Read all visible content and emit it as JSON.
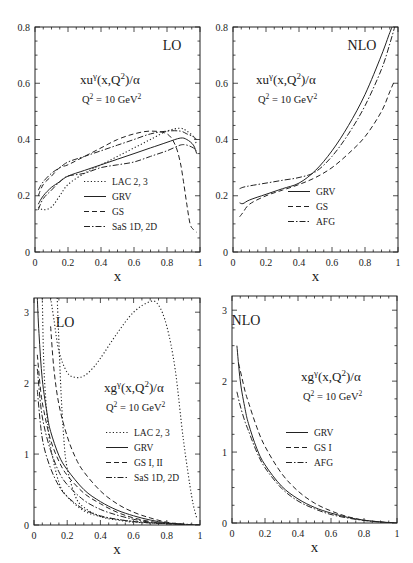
{
  "chart_data": [
    {
      "id": "top-left",
      "type": "line",
      "tag": "LO",
      "title": "xuγ(x,Q²)/α",
      "subtitle": "Q² = 10 GeV²",
      "xlabel": "x",
      "ylabel": "",
      "xlim": [
        0,
        1
      ],
      "ylim": [
        0,
        0.8
      ],
      "xticks": [
        "0",
        "0.2",
        "0.4",
        "0.6",
        "0.8",
        "1"
      ],
      "yticks": [
        "0",
        "0.2",
        "0.4",
        "0.6",
        "0.8"
      ],
      "frame": {
        "x0": 35,
        "x1": 200,
        "y0": 27,
        "y1": 252
      },
      "legend": [
        "LAC 2, 3",
        "GRV",
        "GS",
        "SaS 1D, 2D"
      ],
      "legend_pos": {
        "x": 112,
        "y": 185,
        "dy": 15
      },
      "tag_pos": {
        "x": 172,
        "y": 50
      },
      "title_pos": {
        "x": 80,
        "y": 84
      },
      "series": [
        {
          "name": "LAC 2, 3",
          "style": "dotted",
          "x": [
            0.02,
            0.05,
            0.1,
            0.15,
            0.2,
            0.3,
            0.4,
            0.5,
            0.6,
            0.7,
            0.8,
            0.88,
            0.92,
            0.96,
            0.98
          ],
          "y": [
            0.16,
            0.15,
            0.16,
            0.2,
            0.24,
            0.28,
            0.31,
            0.34,
            0.37,
            0.4,
            0.43,
            0.44,
            0.43,
            0.41,
            0.38
          ]
        },
        {
          "name": "GRV",
          "style": "solid",
          "x": [
            0.02,
            0.05,
            0.1,
            0.15,
            0.2,
            0.3,
            0.4,
            0.5,
            0.6,
            0.7,
            0.8,
            0.88,
            0.92,
            0.96,
            0.98
          ],
          "y": [
            0.17,
            0.2,
            0.23,
            0.25,
            0.27,
            0.29,
            0.31,
            0.33,
            0.35,
            0.37,
            0.39,
            0.405,
            0.4,
            0.38,
            0.35
          ]
        },
        {
          "name": "GS",
          "style": "dashed",
          "x": [
            0.02,
            0.05,
            0.1,
            0.15,
            0.2,
            0.3,
            0.4,
            0.5,
            0.6,
            0.7,
            0.8,
            0.85,
            0.88,
            0.9,
            0.92,
            0.94,
            0.96,
            0.98
          ],
          "y": [
            0.2,
            0.24,
            0.27,
            0.3,
            0.31,
            0.34,
            0.37,
            0.4,
            0.42,
            0.43,
            0.42,
            0.38,
            0.32,
            0.25,
            0.17,
            0.1,
            0.08,
            0.07
          ]
        },
        {
          "name": "SaS 1D, 2D",
          "style": "dashdot",
          "x": [
            0.02,
            0.05,
            0.1,
            0.15,
            0.2,
            0.3,
            0.4,
            0.5,
            0.6,
            0.7,
            0.8,
            0.88,
            0.92,
            0.96,
            0.98
          ],
          "y": [
            0.22,
            0.25,
            0.28,
            0.3,
            0.32,
            0.34,
            0.36,
            0.38,
            0.4,
            0.42,
            0.43,
            0.43,
            0.42,
            0.41,
            0.4
          ]
        },
        {
          "name": "SaS 1D, 2D (lower)",
          "style": "dashdot",
          "x": [
            0.02,
            0.05,
            0.1,
            0.15,
            0.2,
            0.3,
            0.4,
            0.5,
            0.6,
            0.7,
            0.8,
            0.88,
            0.92,
            0.96,
            0.98
          ],
          "y": [
            0.15,
            0.19,
            0.22,
            0.25,
            0.27,
            0.28,
            0.3,
            0.31,
            0.32,
            0.34,
            0.36,
            0.38,
            0.38,
            0.37,
            0.36
          ]
        }
      ]
    },
    {
      "id": "top-right",
      "type": "line",
      "tag": "NLO",
      "title": "xuγ(x,Q²)/α",
      "subtitle": "Q² = 10 GeV²",
      "xlabel": "x",
      "ylabel": "",
      "xlim": [
        0,
        1
      ],
      "ylim": [
        0,
        0.8
      ],
      "xticks": [
        "0",
        "0.2",
        "0.4",
        "0.6",
        "0.8",
        "1"
      ],
      "yticks": [
        "0",
        "0.2",
        "0.4",
        "0.6",
        "0.8"
      ],
      "frame": {
        "x0": 233,
        "x1": 398,
        "y0": 27,
        "y1": 252
      },
      "legend": [
        "GRV",
        "GS",
        "AFG"
      ],
      "legend_pos": {
        "x": 316,
        "y": 195,
        "dy": 15
      },
      "tag_pos": {
        "x": 362,
        "y": 50
      },
      "title_pos": {
        "x": 256,
        "y": 84
      },
      "series": [
        {
          "name": "GRV",
          "style": "solid",
          "x": [
            0.04,
            0.06,
            0.1,
            0.2,
            0.3,
            0.4,
            0.5,
            0.6,
            0.7,
            0.8,
            0.9,
            0.95,
            0.98
          ],
          "y": [
            0.175,
            0.172,
            0.185,
            0.205,
            0.225,
            0.245,
            0.29,
            0.36,
            0.45,
            0.56,
            0.7,
            0.78,
            0.82
          ]
        },
        {
          "name": "GS",
          "style": "dashed",
          "x": [
            0.04,
            0.06,
            0.1,
            0.2,
            0.3,
            0.4,
            0.5,
            0.6,
            0.7,
            0.8,
            0.9,
            0.95,
            0.98
          ],
          "y": [
            0.125,
            0.14,
            0.17,
            0.2,
            0.22,
            0.24,
            0.265,
            0.3,
            0.35,
            0.41,
            0.5,
            0.57,
            0.61
          ]
        },
        {
          "name": "AFG",
          "style": "dashdot",
          "x": [
            0.04,
            0.06,
            0.1,
            0.2,
            0.3,
            0.4,
            0.5,
            0.6,
            0.7,
            0.8,
            0.9,
            0.95,
            0.98
          ],
          "y": [
            0.225,
            0.23,
            0.235,
            0.245,
            0.255,
            0.265,
            0.285,
            0.34,
            0.42,
            0.52,
            0.65,
            0.74,
            0.8
          ]
        }
      ]
    },
    {
      "id": "bottom-left",
      "type": "line",
      "tag": "LO",
      "title": "xgγ(x,Q²)/α",
      "subtitle": "Q² = 10 GeV²",
      "xlabel": "x",
      "ylabel": "",
      "xlim": [
        0,
        1
      ],
      "ylim": [
        0,
        3.2
      ],
      "xticks": [
        "0",
        "0.2",
        "0.4",
        "0.6",
        "0.8",
        "1"
      ],
      "yticks": [
        "0",
        "1",
        "2",
        "3"
      ],
      "frame": {
        "x0": 34,
        "x1": 200,
        "y0": 298,
        "y1": 525
      },
      "legend": [
        "LAC 2, 3",
        "GRV",
        "GS I, II",
        "SaS 1D, 2D"
      ],
      "legend_pos": {
        "x": 134,
        "y": 436,
        "dy": 15
      },
      "tag_pos": {
        "x": 65,
        "y": 327
      },
      "title_pos": {
        "x": 104,
        "y": 392
      },
      "series": [
        {
          "name": "LAC 2, 3 (a)",
          "style": "dotted",
          "x": [
            0.1,
            0.12,
            0.15,
            0.2,
            0.25,
            0.3,
            0.35,
            0.4,
            0.5,
            0.6,
            0.7,
            0.75,
            0.8,
            0.85,
            0.9,
            0.95,
            0.98
          ],
          "y": [
            3.2,
            2.9,
            2.45,
            2.15,
            2.08,
            2.1,
            2.2,
            2.35,
            2.7,
            3.0,
            3.15,
            3.1,
            2.8,
            2.2,
            1.2,
            0.4,
            0.1
          ]
        },
        {
          "name": "LAC 2, 3 (b)",
          "style": "dotted",
          "x": [
            0.14,
            0.16,
            0.18,
            0.2,
            0.25,
            0.3,
            0.4,
            0.5,
            0.6,
            0.7,
            0.8,
            0.9,
            0.95
          ],
          "y": [
            3.2,
            2.0,
            1.2,
            0.8,
            0.4,
            0.25,
            0.12,
            0.07,
            0.04,
            0.03,
            0.02,
            0.01,
            0.01
          ]
        },
        {
          "name": "LAC 2, 3 (c)",
          "style": "dotted",
          "x": [
            0.05,
            0.06,
            0.08,
            0.1,
            0.15,
            0.2,
            0.3,
            0.4,
            0.5,
            0.6,
            0.7,
            0.8
          ],
          "y": [
            3.2,
            2.2,
            1.5,
            1.1,
            0.6,
            0.4,
            0.2,
            0.12,
            0.08,
            0.05,
            0.03,
            0.02
          ]
        },
        {
          "name": "GRV",
          "style": "solid",
          "x": [
            0.02,
            0.03,
            0.05,
            0.08,
            0.1,
            0.15,
            0.2,
            0.3,
            0.4,
            0.5,
            0.6,
            0.7,
            0.8,
            0.9,
            1.0
          ],
          "y": [
            3.2,
            2.7,
            2.05,
            1.55,
            1.32,
            0.98,
            0.78,
            0.5,
            0.33,
            0.21,
            0.13,
            0.07,
            0.03,
            0.01,
            0.0
          ]
        },
        {
          "name": "GS I, II (a)",
          "style": "dashed",
          "x": [
            0.1,
            0.12,
            0.15,
            0.2,
            0.25,
            0.3,
            0.4,
            0.5,
            0.6,
            0.7,
            0.8,
            0.9,
            1.0
          ],
          "y": [
            2.8,
            2.2,
            1.7,
            1.25,
            0.95,
            0.75,
            0.48,
            0.3,
            0.18,
            0.1,
            0.04,
            0.01,
            0.0
          ]
        },
        {
          "name": "GS I, II (b)",
          "style": "dashed",
          "x": [
            0.02,
            0.04,
            0.06,
            0.1,
            0.15,
            0.2,
            0.3,
            0.4,
            0.5,
            0.6,
            0.7,
            0.8,
            0.9
          ],
          "y": [
            2.4,
            1.9,
            1.6,
            1.2,
            0.9,
            0.7,
            0.45,
            0.3,
            0.18,
            0.1,
            0.05,
            0.02,
            0.01
          ]
        },
        {
          "name": "SaS 1D, 2D (a)",
          "style": "dashdot",
          "x": [
            0.02,
            0.04,
            0.06,
            0.1,
            0.15,
            0.2,
            0.3,
            0.4,
            0.5,
            0.6,
            0.7,
            0.8,
            0.9
          ],
          "y": [
            2.2,
            1.7,
            1.4,
            1.05,
            0.75,
            0.57,
            0.35,
            0.22,
            0.14,
            0.08,
            0.04,
            0.02,
            0.01
          ]
        },
        {
          "name": "SaS 1D, 2D (b)",
          "style": "dashdot",
          "x": [
            0.02,
            0.04,
            0.06,
            0.1,
            0.15,
            0.2,
            0.3,
            0.4,
            0.5,
            0.6,
            0.7,
            0.8,
            0.9
          ],
          "y": [
            1.9,
            1.4,
            1.1,
            0.8,
            0.55,
            0.4,
            0.22,
            0.13,
            0.08,
            0.05,
            0.03,
            0.02,
            0.01
          ]
        }
      ]
    },
    {
      "id": "bottom-right",
      "type": "line",
      "tag": "NLO",
      "title": "xgγ(x,Q²)/α",
      "subtitle": "Q² = 10 GeV²",
      "xlabel": "x",
      "ylabel": "",
      "xlim": [
        0,
        1
      ],
      "ylim": [
        0,
        3.2
      ],
      "xticks": [
        "0",
        "0.2",
        "0.4",
        "0.6",
        "0.8",
        "1"
      ],
      "yticks": [
        "0",
        "1",
        "2",
        "3"
      ],
      "frame": {
        "x0": 232,
        "x1": 397,
        "y0": 296,
        "y1": 523
      },
      "legend": [
        "GRV",
        "GS I",
        "AFG"
      ],
      "legend_pos": {
        "x": 314,
        "y": 436,
        "dy": 15
      },
      "tag_pos": {
        "x": 246,
        "y": 325
      },
      "title_pos": {
        "x": 301,
        "y": 381
      },
      "series": [
        {
          "name": "GRV",
          "style": "solid",
          "x": [
            0.03,
            0.05,
            0.08,
            0.1,
            0.15,
            0.2,
            0.3,
            0.4,
            0.5,
            0.6,
            0.7,
            0.8,
            0.9,
            1.0
          ],
          "y": [
            2.5,
            2.0,
            1.6,
            1.4,
            1.05,
            0.82,
            0.52,
            0.34,
            0.22,
            0.14,
            0.08,
            0.04,
            0.015,
            0.0
          ]
        },
        {
          "name": "GS I",
          "style": "dashed",
          "x": [
            0.04,
            0.06,
            0.08,
            0.1,
            0.15,
            0.2,
            0.3,
            0.4,
            0.5,
            0.6,
            0.7,
            0.8,
            0.9,
            1.0
          ],
          "y": [
            2.25,
            2.05,
            1.85,
            1.7,
            1.35,
            1.08,
            0.7,
            0.45,
            0.28,
            0.17,
            0.09,
            0.04,
            0.015,
            0.0
          ]
        },
        {
          "name": "AFG",
          "style": "dashdot",
          "x": [
            0.03,
            0.05,
            0.08,
            0.1,
            0.15,
            0.2,
            0.3,
            0.4,
            0.5,
            0.6,
            0.7,
            0.8,
            0.9,
            1.0
          ],
          "y": [
            1.85,
            1.65,
            1.42,
            1.3,
            1.0,
            0.78,
            0.49,
            0.31,
            0.2,
            0.12,
            0.07,
            0.035,
            0.012,
            0.0
          ]
        }
      ]
    }
  ]
}
